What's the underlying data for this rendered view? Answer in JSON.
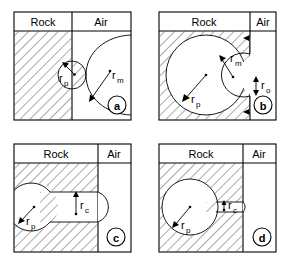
{
  "figure": {
    "background": "#ffffff",
    "line_color": "#000000",
    "hatch_color": "#555555",
    "width": 292,
    "height": 267,
    "panel_count": 4
  },
  "labels": {
    "rock": "Rock",
    "air": "Air",
    "r_p": "r",
    "r_p_sub": "p",
    "r_m": "r",
    "r_m_sub": "m",
    "r_o": "r",
    "r_o_sub": "o",
    "r_c": "r",
    "r_c_sub": "c"
  },
  "panels": [
    {
      "id": "a",
      "tag": "a",
      "position": "top-left",
      "headers": [
        "Rock",
        "Air"
      ],
      "rock_fraction": 0.5,
      "annotations": [
        {
          "name": "pore-radius",
          "symbol": "r",
          "subscript": "p"
        },
        {
          "name": "meniscus-radius",
          "symbol": "r",
          "subscript": "m"
        }
      ],
      "description": "Hemispherical pore at surface with large convex meniscus bulging into air"
    },
    {
      "id": "b",
      "tag": "b",
      "position": "top-right",
      "headers": [
        "Rock",
        "Air"
      ],
      "rock_fraction": 0.78,
      "annotations": [
        {
          "name": "pore-radius",
          "symbol": "r",
          "subscript": "p"
        },
        {
          "name": "meniscus-radius",
          "symbol": "r",
          "subscript": "m"
        },
        {
          "name": "opening-radius",
          "symbol": "r",
          "subscript": "o"
        }
      ],
      "description": "Large spherical pore inside rock connected to air by narrow opening with inner meniscus"
    },
    {
      "id": "c",
      "tag": "c",
      "position": "bottom-left",
      "headers": [
        "Rock",
        "Air"
      ],
      "rock_fraction": 0.72,
      "annotations": [
        {
          "name": "pore-radius",
          "symbol": "r",
          "subscript": "p"
        },
        {
          "name": "channel-radius",
          "symbol": "r",
          "subscript": "c"
        }
      ],
      "description": "Spherical pore joined to air by a wide cylindrical channel"
    },
    {
      "id": "d",
      "tag": "d",
      "position": "bottom-right",
      "headers": [
        "Rock",
        "Air"
      ],
      "rock_fraction": 0.72,
      "annotations": [
        {
          "name": "pore-radius",
          "symbol": "r",
          "subscript": "p"
        },
        {
          "name": "channel-radius",
          "symbol": "r",
          "subscript": "c"
        }
      ],
      "description": "Spherical pore joined to air by a narrow cylindrical channel"
    }
  ]
}
